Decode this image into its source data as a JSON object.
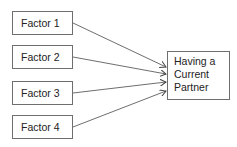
{
  "diagram": {
    "factors": [
      {
        "label": "Factor 1"
      },
      {
        "label": "Factor 2"
      },
      {
        "label": "Factor 3"
      },
      {
        "label": "Factor 4"
      }
    ],
    "outcome": {
      "lines": [
        "Having a",
        "Current",
        "Partner"
      ]
    },
    "edges": [
      {
        "from": "Factor 1",
        "to": "Having a Current Partner"
      },
      {
        "from": "Factor 2",
        "to": "Having a Current Partner"
      },
      {
        "from": "Factor 3",
        "to": "Having a Current Partner"
      },
      {
        "from": "Factor 4",
        "to": "Having a Current Partner"
      }
    ],
    "colors": {
      "stroke": "#6e6e6e",
      "text": "#222222"
    }
  }
}
